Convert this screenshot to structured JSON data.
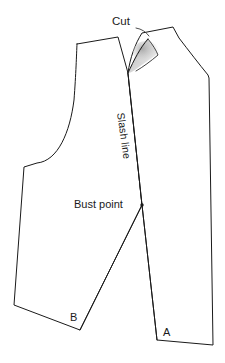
{
  "figure": {
    "background_color": "#ffffff",
    "line_color": "#1a1a1a",
    "shadow_color": "#9a9a9a",
    "line_width": 1
  },
  "labels": {
    "cut": "Cut",
    "slash_line": "Slash line",
    "bust_point": "Bust point",
    "point_a": "A",
    "point_b": "B"
  },
  "icons": {
    "bust_point_marker": "dot-marker-icon",
    "cut_flap": "paper-curl-shadow-icon"
  },
  "geometry": {
    "left_piece_outline": "M 77,44 L 118,37 L 128,73 L 142,205 L 80,330 L 14,305 L 24,167 L 37,163 C 60,160 72,130 75,96 C 76,72 76,54 77,44 Z",
    "right_piece_outline": "M 128,73 C 132,56 137,43 143,33 L 173,27 L 180,38 C 190,52 200,64 209,76 L 209,78 L 213,345 L 157,340 L 142,205 Z",
    "slash_line": "M 128,73 L 142,205",
    "cut_flap_edge": "M 128,73 C 134,60 141,48 150,40 C 146,49 141,57 137,64 C 134,68 131,71 128,73 Z",
    "dart_leg_a": "M 142,205 L 157,340",
    "dart_leg_b": "M 142,205 L 80,330",
    "bust_point_marker": {
      "cx": 142,
      "cy": 205,
      "r": 1.6
    }
  }
}
